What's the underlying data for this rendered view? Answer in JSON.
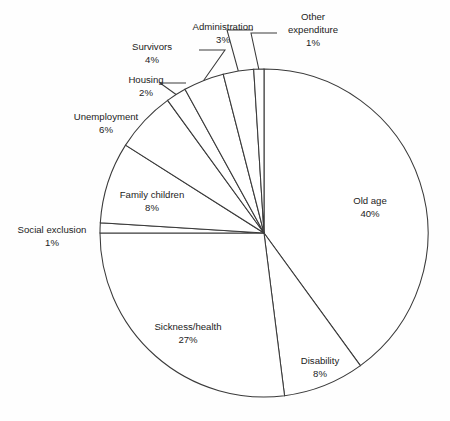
{
  "chart_data": {
    "type": "pie",
    "title": "",
    "xlabel": "",
    "ylabel": "",
    "legend_position": "none",
    "grid": false,
    "unit": "%",
    "start_angle_deg": 0,
    "direction": "clockwise",
    "categories": [
      "Old age",
      "Disability",
      "Sickness/health",
      "Social exclusion",
      "Family children",
      "Unemployment",
      "Housing",
      "Survivors",
      "Administration",
      "Other expenditure"
    ],
    "values": [
      40,
      8,
      27,
      1,
      8,
      6,
      2,
      4,
      3,
      1
    ],
    "slices": [
      {
        "label": "Old age",
        "value": 40,
        "pct_text": "40%",
        "has_leader": false,
        "label_x": 370,
        "label_y": 204,
        "pct_x": 370,
        "pct_y": 217,
        "anchor": "middle"
      },
      {
        "label": "Disability",
        "value": 8,
        "pct_text": "8%",
        "has_leader": false,
        "label_x": 320,
        "label_y": 364,
        "pct_x": 320,
        "pct_y": 377,
        "anchor": "middle"
      },
      {
        "label": "Sickness/health",
        "value": 27,
        "pct_text": "27%",
        "has_leader": false,
        "label_x": 188,
        "label_y": 330,
        "pct_x": 188,
        "pct_y": 343,
        "anchor": "middle"
      },
      {
        "label": "Social exclusion",
        "value": 1,
        "pct_text": "1%",
        "has_leader": false,
        "label_x": 52,
        "label_y": 233,
        "pct_x": 52,
        "pct_y": 246,
        "anchor": "middle"
      },
      {
        "label": "Family children",
        "value": 8,
        "pct_text": "8%",
        "has_leader": false,
        "label_x": 152,
        "label_y": 198,
        "pct_x": 152,
        "pct_y": 211,
        "anchor": "middle"
      },
      {
        "label": "Unemployment",
        "value": 6,
        "pct_text": "6%",
        "has_leader": false,
        "label_x": 106,
        "label_y": 120,
        "pct_x": 106,
        "pct_y": 133,
        "anchor": "middle"
      },
      {
        "label": "Housing",
        "value": 2,
        "pct_text": "2%",
        "has_leader": true,
        "label_x": 146,
        "label_y": 83,
        "pct_x": 146,
        "pct_y": 96,
        "anchor": "middle"
      },
      {
        "label": "Survivors",
        "value": 4,
        "pct_text": "4%",
        "has_leader": true,
        "label_x": 152,
        "label_y": 50,
        "pct_x": 152,
        "pct_y": 63,
        "anchor": "middle"
      },
      {
        "label": "Administration",
        "value": 3,
        "pct_text": "3%",
        "has_leader": true,
        "label_x": 223,
        "label_y": 30,
        "pct_x": 223,
        "pct_y": 43,
        "anchor": "middle"
      },
      {
        "label": "Other expenditure",
        "value": 1,
        "pct_text": "1%",
        "has_leader": true,
        "label_line1": "Other",
        "label_line2": "expenditure",
        "label_x": 313,
        "label_y": 20,
        "pct_x": 313,
        "pct_y": 46,
        "anchor": "middle"
      }
    ],
    "geometry": {
      "center_x": 264,
      "center_y": 233,
      "radius": 164
    },
    "colors": {
      "stroke": "#3a3a3a",
      "fill": "#ffffff",
      "text": "#1c1c1c",
      "background": "#fefefe"
    }
  }
}
